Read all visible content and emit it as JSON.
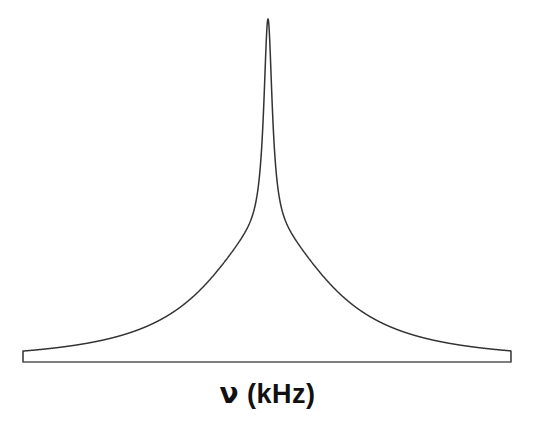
{
  "figure": {
    "background_color": "#ffffff",
    "width": 535,
    "height": 435,
    "curve_color": "#333333",
    "axis_color": "#555555",
    "label_color": "#111111"
  },
  "axis": {
    "x_label_symbol": "ν",
    "x_label_units": " (kHz)",
    "x_label_full": "ν (kHz)",
    "baseline_y": 362,
    "baseline_x_start": 23,
    "baseline_x_end": 511
  },
  "chart_data": {
    "type": "line",
    "title": "",
    "subtitle": "",
    "xlabel": "ν (kHz)",
    "ylabel": "",
    "grid": false,
    "legend": null,
    "axis_visible": {
      "x": true,
      "y": false
    },
    "xlim": [
      -10,
      10
    ],
    "ylim": [
      0,
      1
    ],
    "annotations": [],
    "components": [
      {
        "name": "broad component",
        "shape": "lorentzian-like broad base",
        "center": 0.0,
        "fwhm": 6.0,
        "relative_amplitude": 0.62
      },
      {
        "name": "narrow central peak",
        "shape": "lorentzian sharp spike",
        "center": 0.0,
        "fwhm": 0.42,
        "relative_amplitude": 1.0
      }
    ],
    "series": [
      {
        "name": "signal",
        "x": [
          -10.0,
          -9.5,
          -9.0,
          -8.5,
          -8.0,
          -7.5,
          -7.0,
          -6.5,
          -6.0,
          -5.5,
          -5.0,
          -4.5,
          -4.0,
          -3.5,
          -3.0,
          -2.5,
          -2.0,
          -1.5,
          -1.0,
          -0.8,
          -0.6,
          -0.5,
          -0.4,
          -0.3,
          -0.25,
          -0.2,
          -0.15,
          -0.1,
          -0.05,
          0.0,
          0.05,
          0.1,
          0.15,
          0.2,
          0.25,
          0.3,
          0.4,
          0.5,
          0.6,
          0.8,
          1.0,
          1.5,
          2.0,
          2.5,
          3.0,
          3.5,
          4.0,
          4.5,
          5.0,
          5.5,
          6.0,
          6.5,
          7.0,
          7.5,
          8.0,
          8.5,
          9.0,
          9.5,
          10.0
        ],
        "y": [
          0.006,
          0.007,
          0.008,
          0.009,
          0.011,
          0.013,
          0.016,
          0.019,
          0.024,
          0.031,
          0.04,
          0.053,
          0.072,
          0.101,
          0.147,
          0.219,
          0.326,
          0.45,
          0.556,
          0.586,
          0.612,
          0.626,
          0.644,
          0.676,
          0.701,
          0.74,
          0.797,
          0.869,
          0.953,
          1.0,
          0.953,
          0.869,
          0.797,
          0.74,
          0.701,
          0.676,
          0.644,
          0.626,
          0.612,
          0.586,
          0.556,
          0.45,
          0.326,
          0.219,
          0.147,
          0.101,
          0.072,
          0.053,
          0.04,
          0.031,
          0.024,
          0.019,
          0.016,
          0.013,
          0.011,
          0.009,
          0.008,
          0.007,
          0.006
        ]
      }
    ],
    "peak": {
      "x": 0.0,
      "y": 1.0,
      "pixel_x": 268,
      "pixel_y": 19
    }
  }
}
